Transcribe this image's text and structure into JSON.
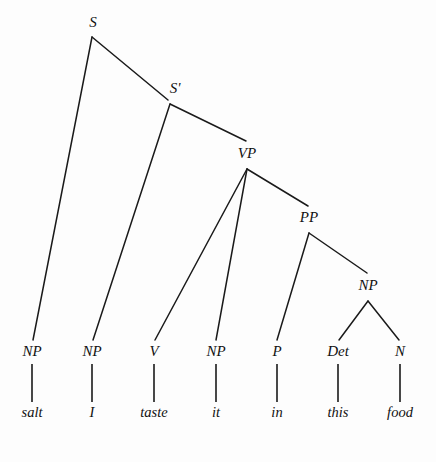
{
  "figure": {
    "type": "constituency-syntax-tree",
    "sentence": "salt I taste it in this food",
    "background_color": "#fdfdfd",
    "line_color": "#1a1a1a"
  },
  "nodes": {
    "s": {
      "label": "S",
      "label_x": 93,
      "label_y": 27,
      "apex_x": 92,
      "apex_y": 37
    },
    "sbar": {
      "label": "S'",
      "label_x": 175,
      "label_y": 93,
      "apex_x": 170,
      "apex_y": 104
    },
    "vp": {
      "label": "VP",
      "label_x": 247,
      "label_y": 158,
      "apex_x": 247,
      "apex_y": 169
    },
    "pp": {
      "label": "PP",
      "label_x": 309,
      "label_y": 222,
      "apex_x": 309,
      "apex_y": 233
    },
    "np_inner": {
      "label": "NP",
      "label_x": 368,
      "label_y": 290,
      "apex_x": 368,
      "apex_y": 301
    }
  },
  "preterminals": [
    {
      "label": "NP",
      "x": 32,
      "label_y": 356,
      "word": "salt",
      "word_y": 417
    },
    {
      "label": "NP",
      "x": 92,
      "label_y": 356,
      "word": "I",
      "word_y": 417
    },
    {
      "label": "V",
      "x": 154,
      "label_y": 356,
      "word": "taste",
      "word_y": 417
    },
    {
      "label": "NP",
      "x": 216,
      "label_y": 356,
      "word": "it",
      "word_y": 417
    },
    {
      "label": "P",
      "x": 277,
      "label_y": 356,
      "word": "in",
      "word_y": 417
    },
    {
      "label": "Det",
      "x": 338,
      "label_y": 356,
      "word": "this",
      "word_y": 417
    },
    {
      "label": "N",
      "x": 400,
      "label_y": 356,
      "word": "food",
      "word_y": 417
    }
  ],
  "stems": [
    {
      "name": "stem-salt",
      "x": 32,
      "y1": 364,
      "y2": 402
    },
    {
      "name": "stem-i",
      "x": 92,
      "y1": 364,
      "y2": 402
    },
    {
      "name": "stem-taste",
      "x": 154,
      "y1": 364,
      "y2": 402
    },
    {
      "name": "stem-it",
      "x": 216,
      "y1": 364,
      "y2": 402
    },
    {
      "name": "stem-in",
      "x": 277,
      "y1": 364,
      "y2": 402
    },
    {
      "name": "stem-this",
      "x": 338,
      "y1": 364,
      "y2": 402
    },
    {
      "name": "stem-food",
      "x": 400,
      "y1": 364,
      "y2": 402
    }
  ],
  "branches": [
    {
      "name": "branch-s-to-np-salt",
      "x1": 92,
      "y1": 37,
      "x2": 33,
      "y2": 340
    },
    {
      "name": "branch-s-to-sbar",
      "x1": 92,
      "y1": 37,
      "x2": 168,
      "y2": 100
    },
    {
      "name": "branch-sbar-to-np-i",
      "x1": 170,
      "y1": 104,
      "x2": 93,
      "y2": 340
    },
    {
      "name": "branch-sbar-to-vp",
      "x1": 170,
      "y1": 104,
      "x2": 246,
      "y2": 141
    },
    {
      "name": "branch-vp-to-v",
      "x1": 247,
      "y1": 169,
      "x2": 155,
      "y2": 340
    },
    {
      "name": "branch-vp-to-np-it",
      "x1": 247,
      "y1": 169,
      "x2": 216,
      "y2": 340
    },
    {
      "name": "branch-vp-to-pp",
      "x1": 247,
      "y1": 169,
      "x2": 308,
      "y2": 206
    },
    {
      "name": "branch-pp-to-p",
      "x1": 309,
      "y1": 233,
      "x2": 277,
      "y2": 340
    },
    {
      "name": "branch-pp-to-np",
      "x1": 309,
      "y1": 233,
      "x2": 367,
      "y2": 273
    },
    {
      "name": "branch-np-to-det",
      "x1": 368,
      "y1": 301,
      "x2": 339,
      "y2": 340
    },
    {
      "name": "branch-np-to-n",
      "x1": 368,
      "y1": 301,
      "x2": 399,
      "y2": 340
    }
  ]
}
